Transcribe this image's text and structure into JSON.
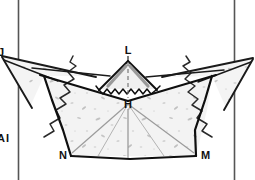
{
  "figure": {
    "kind": "cross-section-diagram",
    "background_color": "#ffffff",
    "ink_color": "#111111",
    "fill_color": "#f2f2f2",
    "speckle_color": "#b9b9b9",
    "width": 255,
    "height": 180
  },
  "frame": {
    "left_rule_label": "left-vertical-rule",
    "right_rule_label": "right-vertical-rule"
  },
  "labels": {
    "apex": "L",
    "center": "H",
    "bottom_left": "N",
    "bottom_right": "M",
    "edge_top_left": "J",
    "edge_lower_left_a": "A",
    "edge_lower_left_b": "I"
  },
  "annotations": {
    "left_break_label": "break-line-left",
    "right_break_label": "break-line-right",
    "zigzag_label": "zigzag-contact-line",
    "axis_label": "vertical-axis-dashed"
  }
}
